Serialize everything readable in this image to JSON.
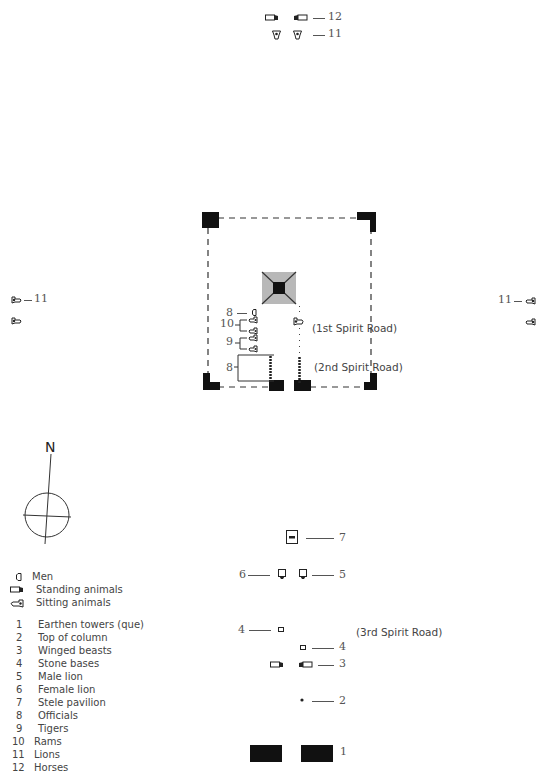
{
  "diagram": {
    "type": "tomb-site-plan",
    "north_label": "N",
    "roads": {
      "first": "(1st Spirit Road)",
      "second": "(2nd Spirit Road)",
      "third": "(3rd Spirit Road)"
    },
    "top_group": {
      "row1_number": "12",
      "row2_number": "11"
    },
    "left_group": {
      "number": "11"
    },
    "right_group": {
      "number": "11"
    },
    "enclosure_labels": {
      "officials_single": "8",
      "rams": "10",
      "tigers": "9",
      "officials_group": "8"
    },
    "lower_labels": {
      "stele_pavilion": "7",
      "female_lion": "6",
      "male_lion": "5",
      "stone_base_left": "4",
      "stone_base_right": "4",
      "winged_beasts": "3",
      "top_of_column": "2",
      "earthen_towers": "1"
    }
  },
  "legend": {
    "symbols": [
      {
        "icon": "men-icon",
        "label": "Men"
      },
      {
        "icon": "standing-animal-icon",
        "label": "Standing animals"
      },
      {
        "icon": "sitting-animal-icon",
        "label": "Sitting animals"
      }
    ],
    "items": [
      {
        "num": "1",
        "label": "Earthen towers (que)"
      },
      {
        "num": "2",
        "label": "Top of column"
      },
      {
        "num": "3",
        "label": "Winged beasts"
      },
      {
        "num": "4",
        "label": "Stone bases"
      },
      {
        "num": "5",
        "label": "Male lion"
      },
      {
        "num": "6",
        "label": "Female lion"
      },
      {
        "num": "7",
        "label": "Stele pavilion"
      },
      {
        "num": "8",
        "label": "Officials"
      },
      {
        "num": "9",
        "label": "Tigers"
      },
      {
        "num": "10",
        "label": "Rams"
      },
      {
        "num": "11",
        "label": "Lions"
      },
      {
        "num": "12",
        "label": "Horses"
      }
    ]
  }
}
